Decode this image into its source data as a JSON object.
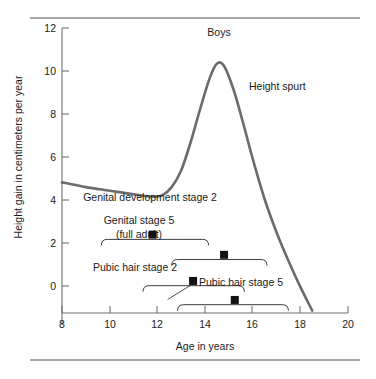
{
  "chart_data": {
    "type": "line",
    "title": "Boys",
    "xlabel": "Age in years",
    "ylabel": "Height gain in centimeters per year",
    "xlim": [
      8,
      20
    ],
    "ylim": [
      0,
      12
    ],
    "xticks": [
      8,
      10,
      12,
      14,
      16,
      18,
      20
    ],
    "yticks": [
      0,
      2,
      4,
      6,
      8,
      10,
      12
    ],
    "grid": false,
    "legend": "none",
    "series": [
      {
        "name": "Height velocity",
        "x": [
          8.0,
          9.0,
          10.0,
          11.0,
          11.8,
          12.2,
          12.6,
          13.0,
          13.4,
          13.8,
          14.2,
          14.5,
          14.8,
          15.2,
          15.6,
          16.0,
          16.5,
          17.0,
          17.5,
          18.0,
          18.5
        ],
        "y": [
          5.5,
          5.3,
          5.15,
          5.0,
          4.9,
          4.95,
          5.3,
          6.0,
          7.2,
          8.6,
          9.9,
          10.5,
          10.4,
          9.4,
          8.0,
          6.5,
          4.8,
          3.4,
          2.2,
          1.1,
          0.1
        ]
      }
    ],
    "annotations": [
      {
        "text": "Height spurt",
        "x": 16.0,
        "y": 8.6
      }
    ],
    "events": [
      {
        "label": "Genital development stage 2",
        "label_x": 11.8,
        "label_y": 4.05,
        "bracket_start": 9.65,
        "bracket_end": 14.15,
        "bracket_y": 3.1,
        "marker_x": 11.8,
        "marker_y": 3.3,
        "leader": false
      },
      {
        "label": "Genital stage 5",
        "label2": "(full adult)",
        "label_x": 10.6,
        "label_y": 2.65,
        "bracket_start": 12.6,
        "bracket_end": 16.6,
        "bracket_y": 2.25,
        "marker_x": 14.8,
        "marker_y": 2.45,
        "leader": false
      },
      {
        "label": "Pubic hair stage 2",
        "label_x": 10.5,
        "label_y": 0.65,
        "bracket_start": 11.4,
        "bracket_end": 15.65,
        "bracket_y": 1.15,
        "marker_x": 13.5,
        "marker_y": 1.35,
        "leader": true
      },
      {
        "label": "Pubic hair stage 5",
        "label_x": 15.0,
        "label_y": 0.0,
        "bracket_start": 12.85,
        "bracket_end": 17.5,
        "bracket_y": 0.35,
        "marker_x": 15.25,
        "marker_y": 0.55,
        "leader": false
      }
    ],
    "colors": {
      "curve": "#6b6b6b",
      "axis": "#6f6f6f",
      "rule": "#8a8a8a",
      "marker": "#111111",
      "text": "#1a1a1a"
    }
  },
  "labels": {
    "title": "Boys",
    "xlabel": "Age in years",
    "ylabel": "Height gain in centimeters per year",
    "annot_height_spurt": "Height spurt",
    "ev0": "Genital development stage 2",
    "ev1a": "Genital stage 5",
    "ev1b": "(full adult)",
    "ev2": "Pubic hair stage 2",
    "ev3": "Pubic hair stage 5",
    "x0": "8",
    "x1": "10",
    "x2": "12",
    "x3": "14",
    "x4": "16",
    "x5": "18",
    "x6": "20",
    "y0": "0",
    "y1": "2",
    "y2": "4",
    "y3": "6",
    "y4": "8",
    "y5": "10",
    "y6": "12"
  }
}
